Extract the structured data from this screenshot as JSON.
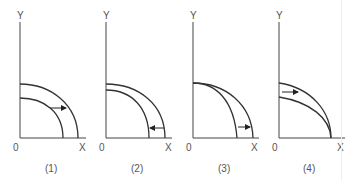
{
  "panels": [
    {
      "caption": "(1)",
      "y_label": "Y",
      "x_label": "X",
      "origin_label": "0",
      "shift": "outward (rightward arrow) — curve shifts out"
    },
    {
      "caption": "(2)",
      "y_label": "Y",
      "x_label": "X",
      "origin_label": "0",
      "shift": "inward (leftward arrow) — curve shifts in"
    },
    {
      "caption": "(3)",
      "y_label": "Y",
      "x_label": "X",
      "origin_label": "0",
      "shift": "rotates outward along X axis, Y intercept fixed"
    },
    {
      "caption": "(4)",
      "y_label": "Y",
      "x_label": "X",
      "origin_label": "0",
      "shift": "rotates outward along Y axis, X intercept fixed"
    }
  ],
  "colors": {
    "line": "#333333",
    "text": "#555555",
    "background": "#ffffff"
  }
}
